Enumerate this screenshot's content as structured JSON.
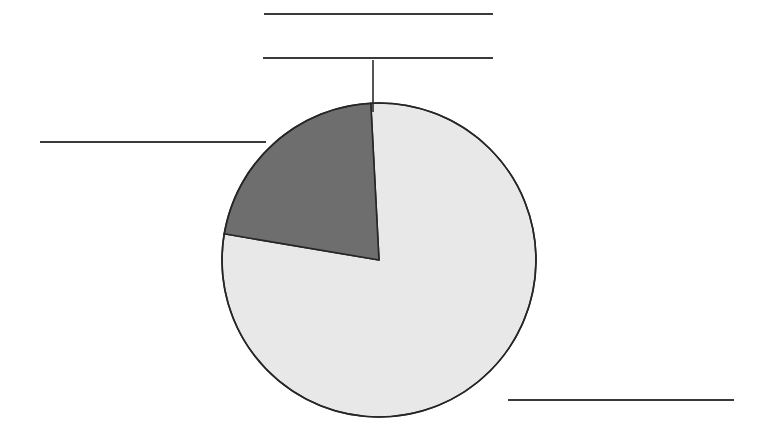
{
  "figure": {
    "background_color": "#ffffff",
    "width": 767,
    "height": 434
  },
  "chart_data": {
    "type": "pie",
    "title": "",
    "subtitle": "",
    "xlabel": "",
    "ylabel": "",
    "legend_position": "none",
    "grid": false,
    "categories": [
      "Slice 1",
      "Slice 2"
    ],
    "values": [
      78.5,
      21.5
    ],
    "units": "percent",
    "total": 100,
    "start_angle_deg": -3,
    "direction": "clockwise",
    "colors": [
      "#e8e8e8",
      "#6e6e6e"
    ],
    "edge_color": "#262626",
    "edge_width": 1.6,
    "center": {
      "x": 379,
      "y": 260
    },
    "radius": 157,
    "slices": [
      {
        "name": "Slice 1",
        "value": 78.5,
        "color": "#e8e8e8",
        "start_angle_deg": -3,
        "end_angle_deg": 279.6,
        "label_text": "",
        "label_redacted": true
      },
      {
        "name": "Slice 2",
        "value": 21.5,
        "color": "#6e6e6e",
        "start_angle_deg": 279.6,
        "end_angle_deg": 357,
        "label_text": "",
        "label_redacted": true
      }
    ],
    "annotations": [
      {
        "id": "label-top-1",
        "text": "",
        "redacted": true,
        "x": 264,
        "y": 13,
        "width": 229
      },
      {
        "id": "label-top-2",
        "text": "",
        "redacted": true,
        "x": 263,
        "y": 57,
        "width": 230
      },
      {
        "id": "label-left",
        "text": "",
        "redacted": true,
        "x": 40,
        "y": 141,
        "width": 226
      },
      {
        "id": "label-bottom-right",
        "text": "",
        "redacted": true,
        "x": 508,
        "y": 399,
        "width": 226
      }
    ],
    "leader_lines": [
      {
        "id": "leader-top",
        "from": {
          "x": 373,
          "y": 60
        },
        "to": {
          "x": 373,
          "y": 112
        },
        "color": "#2b2b2b",
        "width": 1.6
      }
    ]
  },
  "labels": {
    "top_line_1": "",
    "top_line_2": "",
    "left_line": "",
    "bottom_right_line": ""
  },
  "accessibility": {
    "chart_description": "Pie chart with two slices",
    "large_slice_label": "large light gray slice",
    "small_slice_label": "small dark gray slice"
  }
}
